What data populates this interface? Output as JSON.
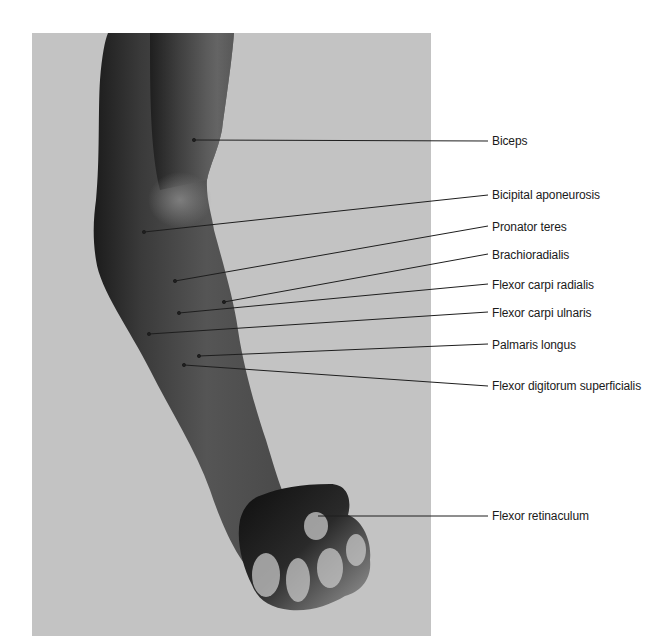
{
  "figure": {
    "background_color": "#ffffff",
    "photo_background_color": "#c3c3c3",
    "labels": [
      {
        "id": "biceps",
        "text": "Biceps",
        "label_y": 141,
        "point": [
          194,
          140
        ],
        "line_end": [
          488,
          141
        ]
      },
      {
        "id": "bicipital-aponeurosis",
        "text": "Bicipital aponeurosis",
        "label_y": 195,
        "point": [
          144,
          232
        ],
        "line_end": [
          488,
          195
        ]
      },
      {
        "id": "pronator-teres",
        "text": "Pronator teres",
        "label_y": 227,
        "point": [
          175,
          281
        ],
        "line_end": [
          488,
          226
        ]
      },
      {
        "id": "brachioradialis",
        "text": "Brachioradialis",
        "label_y": 255,
        "point": [
          224,
          302
        ],
        "line_end": [
          488,
          254
        ]
      },
      {
        "id": "flexor-carpi-radialis",
        "text": "Flexor carpi radialis",
        "label_y": 285,
        "point": [
          179,
          313
        ],
        "line_end": [
          488,
          284
        ]
      },
      {
        "id": "flexor-carpi-ulnaris",
        "text": "Flexor carpi ulnaris",
        "label_y": 313,
        "point": [
          149,
          334
        ],
        "line_end": [
          488,
          312
        ]
      },
      {
        "id": "palmaris-longus",
        "text": "Palmaris longus",
        "label_y": 345,
        "point": [
          199,
          356
        ],
        "line_end": [
          488,
          344
        ]
      },
      {
        "id": "flexor-digitorum-superficialis",
        "text": "Flexor digitorum superficialis",
        "label_y": 386,
        "point": [
          184,
          365
        ],
        "line_end": [
          488,
          386
        ]
      },
      {
        "id": "flexor-retinaculum",
        "text": "Flexor retinaculum",
        "label_y": 516,
        "point": [
          318,
          516
        ],
        "line_end": [
          488,
          516
        ]
      }
    ]
  }
}
